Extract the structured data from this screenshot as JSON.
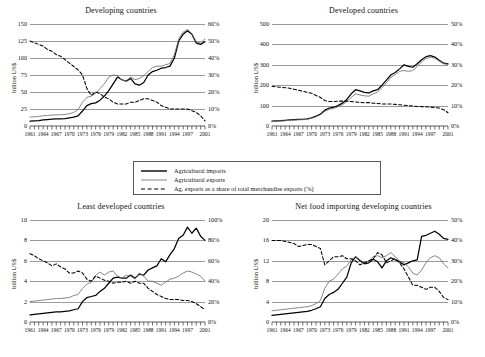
{
  "legend": {
    "items": [
      {
        "label": "Agricultural imports",
        "style": "solid-thick",
        "color": "#000000"
      },
      {
        "label": "Agricultural exports",
        "style": "solid-thin",
        "color": "#555555"
      },
      {
        "label": "Ag. exports as a share of total merchandise exports (%)",
        "style": "dashed",
        "color": "#000000"
      }
    ]
  },
  "common": {
    "ylabel": "billion US$",
    "xtick_labels": [
      "1961",
      "1964",
      "1967",
      "1970",
      "1973",
      "1976",
      "1979",
      "1982",
      "1985",
      "1988",
      "1991",
      "1994",
      "1997",
      "2001"
    ],
    "xtick_years": [
      1961,
      1964,
      1967,
      1970,
      1973,
      1976,
      1979,
      1982,
      1985,
      1988,
      1991,
      1994,
      1997,
      2001
    ],
    "x_start": 1961,
    "x_end": 2001
  },
  "chart_data": [
    {
      "type": "line",
      "panel": "top-left",
      "title": "Developing countries",
      "xlabel": "",
      "ylabel": "billion US$",
      "ylim": [
        0,
        150
      ],
      "yticks": [
        0,
        25,
        50,
        75,
        100,
        125,
        150
      ],
      "y2label": "",
      "y2lim": [
        0,
        60
      ],
      "y2ticks": [
        "0%",
        "10%",
        "20%",
        "30%",
        "40%",
        "50%",
        "60%"
      ],
      "grid": true,
      "x": [
        1961,
        1962,
        1963,
        1964,
        1965,
        1966,
        1967,
        1968,
        1969,
        1970,
        1971,
        1972,
        1973,
        1974,
        1975,
        1976,
        1977,
        1978,
        1979,
        1980,
        1981,
        1982,
        1983,
        1984,
        1985,
        1986,
        1987,
        1988,
        1989,
        1990,
        1991,
        1992,
        1993,
        1994,
        1995,
        1996,
        1997,
        1998,
        1999,
        2000,
        2001
      ],
      "series": [
        {
          "name": "Agricultural imports",
          "axis": "left",
          "values": [
            7,
            7.5,
            8,
            9,
            9.5,
            10,
            10.5,
            10.5,
            11,
            12,
            13,
            15,
            22,
            30,
            33,
            34,
            38,
            44,
            52,
            62,
            72,
            68,
            66,
            70,
            62,
            60,
            64,
            75,
            80,
            82,
            85,
            86,
            88,
            100,
            125,
            135,
            140,
            135,
            122,
            120,
            124
          ]
        },
        {
          "name": "Agricultural exports",
          "axis": "left",
          "values": [
            13,
            13.5,
            14,
            15,
            15.5,
            16,
            16.5,
            16.5,
            17,
            18,
            20,
            24,
            35,
            42,
            44,
            48,
            55,
            62,
            72,
            75,
            74,
            68,
            66,
            72,
            68,
            70,
            74,
            80,
            86,
            88,
            88,
            90,
            92,
            105,
            128,
            138,
            142,
            136,
            124,
            122,
            128
          ]
        },
        {
          "name": "Ag. exports as a share of total merchandise exports (%)",
          "axis": "right",
          "values": [
            50,
            49,
            48,
            47,
            45,
            44,
            42,
            41,
            39,
            37,
            35,
            33,
            30,
            22,
            18,
            20,
            19,
            17,
            16,
            14,
            13,
            13,
            13,
            14,
            14,
            15,
            16,
            16,
            15,
            14,
            12,
            11,
            10,
            10,
            10,
            10,
            10,
            9,
            8,
            6,
            3
          ]
        }
      ]
    },
    {
      "type": "line",
      "panel": "top-right",
      "title": "Developed countries",
      "xlabel": "",
      "ylabel": "billion US$",
      "ylim": [
        0,
        500
      ],
      "yticks": [
        0,
        100,
        200,
        300,
        400,
        500
      ],
      "y2label": "",
      "y2lim": [
        0,
        50
      ],
      "y2ticks": [
        "0%",
        "10%",
        "20%",
        "30%",
        "40%",
        "50%"
      ],
      "grid": true,
      "x": [
        1961,
        1962,
        1963,
        1964,
        1965,
        1966,
        1967,
        1968,
        1969,
        1970,
        1971,
        1972,
        1973,
        1974,
        1975,
        1976,
        1977,
        1978,
        1979,
        1980,
        1981,
        1982,
        1983,
        1984,
        1985,
        1986,
        1987,
        1988,
        1989,
        1990,
        1991,
        1992,
        1993,
        1994,
        1995,
        1996,
        1997,
        1998,
        1999,
        2000,
        2001
      ],
      "series": [
        {
          "name": "Agricultural imports",
          "axis": "left",
          "values": [
            24,
            25,
            26,
            28,
            30,
            31,
            32,
            33,
            35,
            40,
            48,
            58,
            78,
            88,
            92,
            100,
            112,
            130,
            158,
            178,
            172,
            165,
            162,
            172,
            178,
            200,
            225,
            250,
            262,
            280,
            300,
            292,
            288,
            305,
            325,
            340,
            345,
            338,
            322,
            308,
            305
          ]
        },
        {
          "name": "Agricultural exports",
          "axis": "left",
          "values": [
            22,
            23,
            24,
            26,
            28,
            29,
            30,
            31,
            33,
            38,
            45,
            55,
            72,
            82,
            86,
            94,
            104,
            120,
            140,
            158,
            152,
            148,
            146,
            158,
            166,
            188,
            212,
            238,
            252,
            268,
            272,
            268,
            272,
            292,
            315,
            330,
            338,
            332,
            318,
            305,
            302
          ]
        },
        {
          "name": "Ag. exports as a share of total merchandise exports (%)",
          "axis": "right",
          "values": [
            19.5,
            19.2,
            19,
            18.8,
            18.5,
            18,
            17.5,
            17,
            16.5,
            16,
            15,
            14,
            12.5,
            12,
            12,
            12.2,
            12.2,
            12.2,
            12,
            11.8,
            11.6,
            11.4,
            11.5,
            11.2,
            11,
            10.8,
            10.8,
            10.8,
            10.6,
            10.4,
            10.2,
            10,
            9.8,
            9.6,
            9.5,
            9.4,
            9.3,
            9,
            8.8,
            8,
            6.5
          ]
        }
      ]
    },
    {
      "type": "line",
      "panel": "bottom-left",
      "title": "Least developed countries",
      "xlabel": "",
      "ylabel": "billion US$",
      "ylim": [
        0,
        10
      ],
      "yticks": [
        0,
        2,
        4,
        6,
        8,
        10
      ],
      "y2label": "",
      "y2lim": [
        0,
        100
      ],
      "y2ticks": [
        "0%",
        "20%",
        "40%",
        "60%",
        "80%",
        "100%"
      ],
      "grid": true,
      "x": [
        1961,
        1962,
        1963,
        1964,
        1965,
        1966,
        1967,
        1968,
        1969,
        1970,
        1971,
        1972,
        1973,
        1974,
        1975,
        1976,
        1977,
        1978,
        1979,
        1980,
        1981,
        1982,
        1983,
        1984,
        1985,
        1986,
        1987,
        1988,
        1989,
        1990,
        1991,
        1992,
        1993,
        1994,
        1995,
        1996,
        1997,
        1998,
        1999,
        2000,
        2001
      ],
      "series": [
        {
          "name": "Agricultural imports",
          "axis": "left",
          "values": [
            0.7,
            0.75,
            0.8,
            0.85,
            0.9,
            0.95,
            1.0,
            1.0,
            1.05,
            1.1,
            1.2,
            1.3,
            2.0,
            2.4,
            2.5,
            2.6,
            3.0,
            3.3,
            3.8,
            4.3,
            4.4,
            4.3,
            4.3,
            4.6,
            4.3,
            4.7,
            4.6,
            5.1,
            5.3,
            5.5,
            6.2,
            5.9,
            6.6,
            7.2,
            8.2,
            8.5,
            9.3,
            8.7,
            9.2,
            8.4,
            8.0
          ]
        },
        {
          "name": "Agricultural exports",
          "axis": "left",
          "values": [
            2.0,
            2.05,
            2.1,
            2.15,
            2.2,
            2.25,
            2.3,
            2.3,
            2.35,
            2.4,
            2.6,
            2.7,
            3.3,
            3.7,
            3.9,
            4.6,
            4.9,
            4.6,
            4.9,
            5.0,
            4.5,
            4.3,
            4.6,
            4.5,
            4.2,
            4.8,
            4.5,
            4.0,
            4.0,
            3.8,
            3.6,
            3.9,
            4.2,
            4.3,
            4.5,
            4.8,
            5.0,
            4.9,
            4.7,
            4.5,
            4.0
          ]
        },
        {
          "name": "Ag. exports as a share of total merchandise exports (%)",
          "axis": "right",
          "values": [
            67,
            65,
            62,
            60,
            58,
            55,
            57,
            54,
            52,
            48,
            48,
            50,
            48,
            42,
            40,
            45,
            43,
            41,
            40,
            38,
            39,
            39,
            40,
            38,
            40,
            38,
            38,
            33,
            30,
            27,
            25,
            23,
            22,
            22,
            22,
            21,
            21,
            20,
            18,
            15,
            12
          ]
        }
      ]
    },
    {
      "type": "line",
      "panel": "bottom-right",
      "title": "Net food importing developing countries",
      "xlabel": "",
      "ylabel": "billion US$",
      "ylim": [
        0,
        20
      ],
      "yticks": [
        0,
        4,
        8,
        12,
        16,
        20
      ],
      "y2label": "",
      "y2lim": [
        0,
        50
      ],
      "y2ticks": [
        "0%",
        "10%",
        "20%",
        "30%",
        "40%",
        "50%"
      ],
      "grid": true,
      "x": [
        1961,
        1962,
        1963,
        1964,
        1965,
        1966,
        1967,
        1968,
        1969,
        1970,
        1971,
        1972,
        1973,
        1974,
        1975,
        1976,
        1977,
        1978,
        1979,
        1980,
        1981,
        1982,
        1983,
        1984,
        1985,
        1986,
        1987,
        1988,
        1989,
        1990,
        1991,
        1992,
        1993,
        1994,
        1995,
        1996,
        1997,
        1998,
        1999,
        2000,
        2001
      ],
      "series": [
        {
          "name": "Agricultural imports",
          "axis": "left",
          "values": [
            1.3,
            1.4,
            1.5,
            1.6,
            1.7,
            1.8,
            1.9,
            2.0,
            2.1,
            2.3,
            2.6,
            3.0,
            4.6,
            5.4,
            5.8,
            6.4,
            7.6,
            8.8,
            11.6,
            12.8,
            12.0,
            11.4,
            11.6,
            12.3,
            11.8,
            10.6,
            12.0,
            12.6,
            12.2,
            11.8,
            11.2,
            11.6,
            12.0,
            12.2,
            16.8,
            17.0,
            17.4,
            17.8,
            17.2,
            16.4,
            16.2
          ]
        },
        {
          "name": "Agricultural exports",
          "axis": "left",
          "values": [
            2.2,
            2.3,
            2.4,
            2.5,
            2.6,
            2.7,
            2.8,
            2.9,
            3.0,
            3.2,
            3.6,
            4.2,
            6.6,
            8.0,
            8.4,
            9.4,
            10.4,
            11.0,
            12.2,
            12.8,
            12.2,
            11.6,
            11.8,
            12.8,
            13.0,
            12.6,
            13.0,
            13.6,
            12.8,
            12.0,
            11.6,
            10.8,
            9.6,
            9.2,
            10.2,
            11.6,
            12.6,
            13.0,
            12.6,
            11.4,
            10.6
          ]
        },
        {
          "name": "Ag. exports as a share of total merchandise exports (%)",
          "axis": "right",
          "values": [
            40,
            40,
            40,
            39.5,
            39,
            38.5,
            37,
            37.5,
            38,
            38,
            37,
            36,
            28,
            30,
            32,
            32,
            32.5,
            31,
            31,
            30,
            28,
            29,
            30,
            31,
            34,
            33,
            29,
            30,
            31,
            29,
            26,
            22,
            18,
            18,
            17,
            16,
            17,
            17,
            15,
            12,
            11
          ]
        }
      ]
    }
  ]
}
